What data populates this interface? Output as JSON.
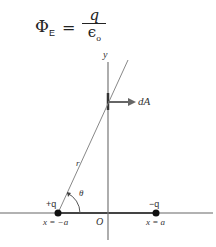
{
  "formula": {
    "lhs": "Φ",
    "lhs_sub": "E",
    "equals": "=",
    "numerator": "q",
    "denominator": "ϵ",
    "denominator_sub": "o"
  },
  "diagram": {
    "y_axis_label": "y",
    "origin_label": "O",
    "area_vector_label": "dA",
    "distance_label": "r",
    "angle_label": "θ",
    "positive_charge": {
      "label": "+q",
      "position_label": "x = −a"
    },
    "negative_charge": {
      "label": "−q",
      "position_label": "x = a"
    },
    "colors": {
      "axis": "#555555",
      "charge": "#111111",
      "arrow": "#555555"
    }
  }
}
